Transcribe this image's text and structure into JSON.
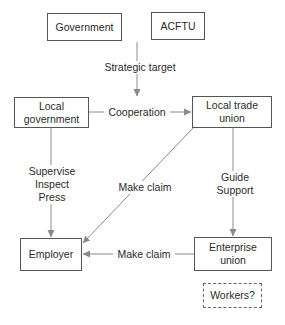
{
  "diagram": {
    "type": "flowchart",
    "nodes": {
      "government": {
        "label": "Government"
      },
      "acftu": {
        "label": "ACFTU"
      },
      "local_government": {
        "label": "Local\ngovernment"
      },
      "local_trade_union": {
        "label": "Local trade\nunion"
      },
      "employer": {
        "label": "Employer"
      },
      "enterprise_union": {
        "label": "Enterprise\nunion"
      },
      "workers": {
        "label": "Workers?",
        "style": "dashed"
      }
    },
    "edges": {
      "strategic_target": {
        "from": "acftu",
        "to": "local_trade_union",
        "label": "Strategic target"
      },
      "cooperation": {
        "from": "local_government",
        "to": "local_trade_union",
        "label": "Cooperation"
      },
      "supervise": {
        "from": "local_government",
        "to": "employer",
        "label": "Supervise\nInspect\nPress"
      },
      "make_claim_diagonal": {
        "from": "local_trade_union",
        "to": "employer",
        "label": "Make claim"
      },
      "guide_support": {
        "from": "local_trade_union",
        "to": "enterprise_union",
        "label": "Guide\nSupport"
      },
      "make_claim_bottom": {
        "from": "enterprise_union",
        "to": "employer",
        "label": "Make claim"
      }
    },
    "colors": {
      "line": "#8a8a8a",
      "border": "#555555",
      "text": "#2a2a2a",
      "background": "#ffffff"
    }
  }
}
